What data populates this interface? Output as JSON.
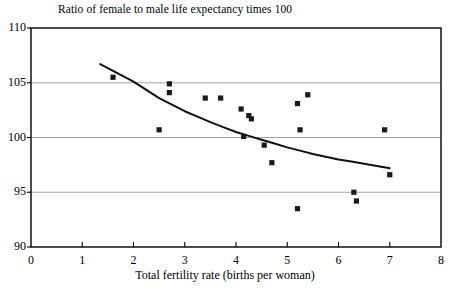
{
  "chart_data": {
    "type": "scatter",
    "title": "Ratio of female to male life expectancy times 100",
    "xlabel": "Total fertility rate (births per woman)",
    "ylabel": "",
    "xlim": [
      0,
      8
    ],
    "ylim": [
      90,
      110
    ],
    "xticks": [
      0,
      1,
      2,
      3,
      4,
      5,
      6,
      7,
      8
    ],
    "yticks": [
      90,
      95,
      100,
      105,
      110
    ],
    "xtick_labels": [
      "0",
      "1",
      "2",
      "3",
      "4",
      "5",
      "6",
      "7",
      "8"
    ],
    "ytick_labels": [
      "90",
      "95",
      "100",
      "105",
      "110"
    ],
    "grid": "horizontal gridlines at 95, 100, 105",
    "gridlines_y": [
      95,
      100,
      105
    ],
    "legend": "none",
    "marker": "filled square",
    "marker_color": "#1a1a1a",
    "points": [
      {
        "x": 1.6,
        "y": 105.5
      },
      {
        "x": 2.5,
        "y": 100.7
      },
      {
        "x": 2.7,
        "y": 104.9
      },
      {
        "x": 2.7,
        "y": 104.1
      },
      {
        "x": 3.4,
        "y": 103.6
      },
      {
        "x": 3.7,
        "y": 103.6
      },
      {
        "x": 4.1,
        "y": 102.6
      },
      {
        "x": 4.25,
        "y": 102.0
      },
      {
        "x": 4.3,
        "y": 101.7
      },
      {
        "x": 4.15,
        "y": 100.1
      },
      {
        "x": 4.55,
        "y": 99.3
      },
      {
        "x": 4.7,
        "y": 97.7
      },
      {
        "x": 5.2,
        "y": 103.1
      },
      {
        "x": 5.4,
        "y": 103.9
      },
      {
        "x": 5.25,
        "y": 100.7
      },
      {
        "x": 5.2,
        "y": 93.5
      },
      {
        "x": 6.3,
        "y": 95.0
      },
      {
        "x": 6.35,
        "y": 94.2
      },
      {
        "x": 6.9,
        "y": 100.7
      },
      {
        "x": 7.0,
        "y": 96.6
      }
    ],
    "trend_line": {
      "description": "smooth downward-sloping fitted curve",
      "color": "#111111",
      "points": [
        {
          "x": 1.35,
          "y": 106.7
        },
        {
          "x": 2.0,
          "y": 105.1
        },
        {
          "x": 2.5,
          "y": 103.6
        },
        {
          "x": 3.0,
          "y": 102.4
        },
        {
          "x": 3.5,
          "y": 101.4
        },
        {
          "x": 4.0,
          "y": 100.5
        },
        {
          "x": 4.5,
          "y": 99.8
        },
        {
          "x": 5.0,
          "y": 99.1
        },
        {
          "x": 5.5,
          "y": 98.5
        },
        {
          "x": 6.0,
          "y": 98.0
        },
        {
          "x": 6.5,
          "y": 97.6
        },
        {
          "x": 7.0,
          "y": 97.2
        }
      ]
    },
    "colors": {
      "axis": "#000000",
      "gridline": "#9a9a9a",
      "marker": "#1a1a1a",
      "trend": "#111111",
      "background": "#ffffff"
    }
  }
}
